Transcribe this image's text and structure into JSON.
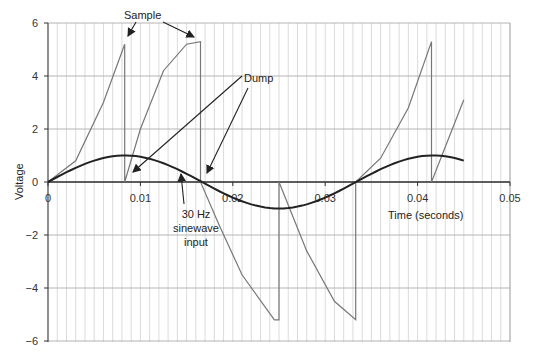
{
  "chart_data": {
    "type": "line",
    "title": "",
    "xlabel": "Time (seconds)",
    "ylabel": "Voltage",
    "xlim": [
      0,
      0.05
    ],
    "ylim": [
      -6,
      6
    ],
    "x_ticks": [
      "0",
      "0.01",
      "0.02",
      "0.03",
      "0.04",
      "0.05"
    ],
    "y_ticks": [
      "6",
      "4",
      "2",
      "0",
      "−2",
      "−4",
      "−6"
    ],
    "grid": {
      "vertical_minor_step": 0.001,
      "horizontal_step": 2
    },
    "legend": null,
    "series": [
      {
        "name": "30 Hz sinewave input",
        "color": "#222222",
        "x": [
          0,
          0.0042,
          0.0083,
          0.0125,
          0.0167,
          0.0208,
          0.025,
          0.0292,
          0.0333,
          0.0375,
          0.0417,
          0.045
        ],
        "y": [
          0,
          0.71,
          1.0,
          0.71,
          0,
          -0.71,
          -1.0,
          -0.71,
          0,
          0.71,
          1.0,
          0.88
        ]
      },
      {
        "name": "Integrator output",
        "color": "#777777",
        "x": [
          0,
          0.003,
          0.006,
          0.0083,
          0.0083,
          0.01,
          0.0125,
          0.015,
          0.0165,
          0.0165,
          0.0185,
          0.021,
          0.0245,
          0.025,
          0.025,
          0.028,
          0.031,
          0.0333,
          0.0333,
          0.036,
          0.039,
          0.0415,
          0.0415,
          0.045
        ],
        "y": [
          0,
          0.8,
          3.0,
          5.2,
          0,
          2.0,
          4.2,
          5.2,
          5.3,
          0,
          -1.6,
          -3.5,
          -5.2,
          -5.2,
          0,
          -2.6,
          -4.5,
          -5.2,
          0,
          0.9,
          2.8,
          5.3,
          0,
          3.1
        ]
      }
    ],
    "annotations": [
      {
        "text": "Sample",
        "points_to": [
          [
            0.0083,
            5.2
          ],
          [
            0.0165,
            5.3
          ]
        ]
      },
      {
        "text": "Dump",
        "points_to": [
          [
            0.0095,
            0.1
          ],
          [
            0.0175,
            0.2
          ]
        ]
      },
      {
        "text": "30 Hz\nsinewave\ninput",
        "lines": [
          "30 Hz",
          "sinewave",
          "input"
        ],
        "points_to": [
          [
            0.0145,
            0.3
          ]
        ]
      }
    ]
  }
}
